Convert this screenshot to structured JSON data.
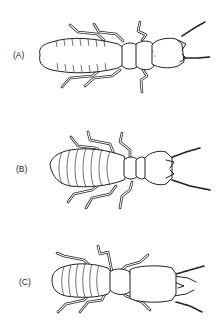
{
  "figure": {
    "panels": [
      {
        "label": "(A)",
        "description": "termite caste with long segmented abdomen and narrow head"
      },
      {
        "label": "(B)",
        "description": "termite caste with broad striped abdomen and rounded head"
      },
      {
        "label": "(C)",
        "description": "termite soldier caste with large elongated head and mandibles"
      }
    ]
  }
}
